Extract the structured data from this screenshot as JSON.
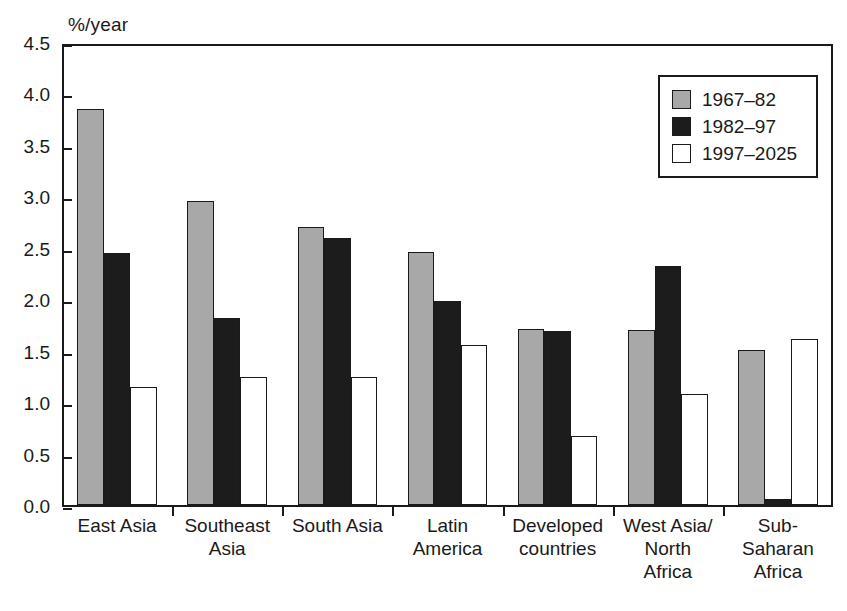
{
  "chart_data": {
    "type": "bar",
    "title": "",
    "xlabel": "",
    "ylabel": "%/year",
    "ylim": [
      0.0,
      4.5
    ],
    "yticks": [
      "0.0",
      "0.5",
      "1.0",
      "1.5",
      "2.0",
      "2.5",
      "3.0",
      "3.5",
      "4.0",
      "4.5"
    ],
    "grid": false,
    "legend_position": "top-right",
    "categories": [
      "East Asia",
      "Southeast Asia",
      "South Asia",
      "Latin America",
      "Developed countries",
      "West Asia/ North Africa",
      "Sub- Saharan Africa"
    ],
    "category_lines": [
      [
        "East Asia"
      ],
      [
        "Southeast",
        "Asia"
      ],
      [
        "South Asia"
      ],
      [
        "Latin",
        "America"
      ],
      [
        "Developed",
        "countries"
      ],
      [
        "West Asia/",
        "North",
        "Africa"
      ],
      [
        "Sub-",
        "Saharan",
        "Africa"
      ]
    ],
    "series": [
      {
        "name": "1967–82",
        "color": "#a8a8a8",
        "values": [
          3.85,
          2.95,
          2.7,
          2.46,
          1.71,
          1.7,
          1.51
        ]
      },
      {
        "name": "1982–97",
        "color": "#1c1c1c",
        "values": [
          2.45,
          1.82,
          2.6,
          1.98,
          1.69,
          2.32,
          0.06
        ]
      },
      {
        "name": "1997–2025",
        "color": "#ffffff",
        "values": [
          1.15,
          1.24,
          1.24,
          1.56,
          0.67,
          1.08,
          1.61
        ]
      }
    ]
  },
  "legend": {
    "entries": [
      {
        "label": "1967–82"
      },
      {
        "label": "1982–97"
      },
      {
        "label": "1997–2025"
      }
    ]
  }
}
